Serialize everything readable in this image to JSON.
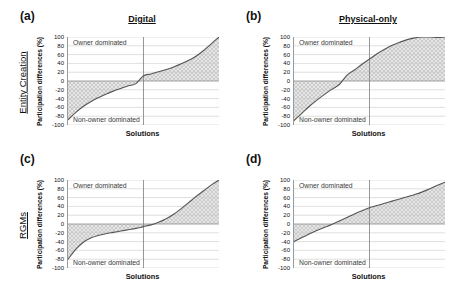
{
  "figure": {
    "columns": [
      {
        "key": "digital",
        "title": "Digital"
      },
      {
        "key": "physical",
        "title": "Physical-only"
      }
    ],
    "rows": [
      {
        "key": "entity_creation",
        "label": "Entity Creation"
      },
      {
        "key": "rgms",
        "label": "RGMs"
      }
    ],
    "axis": {
      "ylabel": "Participation differences (%)",
      "xlabel": "Solutions",
      "yticks": [
        100,
        80,
        60,
        40,
        20,
        0,
        -20,
        -40,
        -60,
        -80,
        -100
      ],
      "ytick_labels": [
        "100",
        "80",
        "60",
        "40",
        "20",
        "0",
        "-20",
        "-40",
        "-60",
        "-80",
        "-100"
      ],
      "ylim": [
        -100,
        100
      ],
      "xlim": [
        0,
        100
      ],
      "grid": "horizontal",
      "reference_line_x": 50,
      "zero_line_y": 0
    },
    "annotations": {
      "owner": "Owner dominated",
      "non_owner": "Non-owner dominated"
    },
    "colors": {
      "curve": "#555555",
      "gridline": "#c9c9c9",
      "zero_line": "#8c8c8c",
      "reference_line": "#7d7d7d",
      "hatch": "#b8b8b8",
      "shade_fill": "#e6e6e6",
      "axis": "#9a9a9a",
      "text": "#111111",
      "annotation_text": "#3a3a3a"
    }
  },
  "chart_data": [
    {
      "type": "line",
      "panel": "a",
      "panel_label": "(a)",
      "row": "Entity Creation",
      "column": "Digital",
      "title": "Digital",
      "xlabel": "Solutions",
      "ylabel": "Participation differences (%)",
      "ylim": [
        -100,
        100
      ],
      "xlim": [
        0,
        100
      ],
      "yticks": [
        100,
        80,
        60,
        40,
        20,
        0,
        -20,
        -40,
        -60,
        -80,
        -100
      ],
      "grid": "horizontal",
      "annotations": [
        "Owner dominated",
        "Non-owner dominated"
      ],
      "reference_line_x": 50,
      "x": [
        0,
        5,
        10,
        15,
        20,
        25,
        30,
        35,
        40,
        45,
        50,
        55,
        60,
        65,
        70,
        75,
        80,
        85,
        90,
        95,
        100
      ],
      "values": [
        -88,
        -72,
        -58,
        -47,
        -38,
        -30,
        -23,
        -17,
        -11,
        -6,
        12,
        16,
        21,
        26,
        32,
        39,
        47,
        57,
        70,
        85,
        100
      ]
    },
    {
      "type": "line",
      "panel": "b",
      "panel_label": "(b)",
      "row": "Entity Creation",
      "column": "Physical-only",
      "title": "Physical-only",
      "xlabel": "Solutions",
      "ylabel": "Participation differences (%)",
      "ylim": [
        -100,
        100
      ],
      "xlim": [
        0,
        100
      ],
      "yticks": [
        100,
        80,
        60,
        40,
        20,
        0,
        -20,
        -40,
        -60,
        -80,
        -100
      ],
      "grid": "horizontal",
      "annotations": [
        "Owner dominated",
        "Non-owner dominated"
      ],
      "reference_line_x": 50,
      "x": [
        0,
        5,
        10,
        15,
        20,
        25,
        30,
        35,
        40,
        45,
        50,
        55,
        60,
        65,
        70,
        75,
        80,
        85,
        90,
        95,
        100
      ],
      "values": [
        -90,
        -74,
        -58,
        -44,
        -31,
        -19,
        -8,
        13,
        25,
        38,
        50,
        62,
        72,
        81,
        88,
        94,
        98,
        100,
        100,
        99,
        100
      ]
    },
    {
      "type": "line",
      "panel": "c",
      "panel_label": "(c)",
      "row": "RGMs",
      "column": "Digital",
      "title": "Digital",
      "xlabel": "Solutions",
      "ylabel": "Participation differences (%)",
      "ylim": [
        -100,
        100
      ],
      "xlim": [
        0,
        100
      ],
      "yticks": [
        100,
        80,
        60,
        40,
        20,
        0,
        -20,
        -40,
        -60,
        -80,
        -100
      ],
      "grid": "horizontal",
      "annotations": [
        "Owner dominated",
        "Non-owner dominated"
      ],
      "reference_line_x": 50,
      "x": [
        0,
        5,
        10,
        15,
        20,
        25,
        30,
        35,
        40,
        45,
        50,
        55,
        60,
        65,
        70,
        75,
        80,
        85,
        90,
        95,
        100
      ],
      "values": [
        -80,
        -58,
        -42,
        -32,
        -26,
        -22,
        -19,
        -16,
        -13,
        -10,
        -6,
        -2,
        4,
        12,
        22,
        35,
        49,
        63,
        76,
        89,
        100
      ]
    },
    {
      "type": "line",
      "panel": "d",
      "panel_label": "(d)",
      "row": "RGMs",
      "column": "Physical-only",
      "title": "Physical-only",
      "xlabel": "Solutions",
      "ylabel": "Participation differences (%)",
      "ylim": [
        -100,
        100
      ],
      "xlim": [
        0,
        100
      ],
      "yticks": [
        100,
        80,
        60,
        40,
        20,
        0,
        -20,
        -40,
        -60,
        -80,
        -100
      ],
      "grid": "horizontal",
      "annotations": [
        "Owner dominated",
        "Non-owner dominated"
      ],
      "reference_line_x": 50,
      "x": [
        0,
        5,
        10,
        15,
        20,
        25,
        30,
        35,
        40,
        45,
        50,
        55,
        60,
        65,
        70,
        75,
        80,
        85,
        90,
        95,
        100
      ],
      "values": [
        -40,
        -31,
        -23,
        -15,
        -8,
        -1,
        7,
        15,
        23,
        30,
        37,
        42,
        47,
        52,
        57,
        62,
        67,
        73,
        80,
        88,
        95
      ]
    }
  ]
}
